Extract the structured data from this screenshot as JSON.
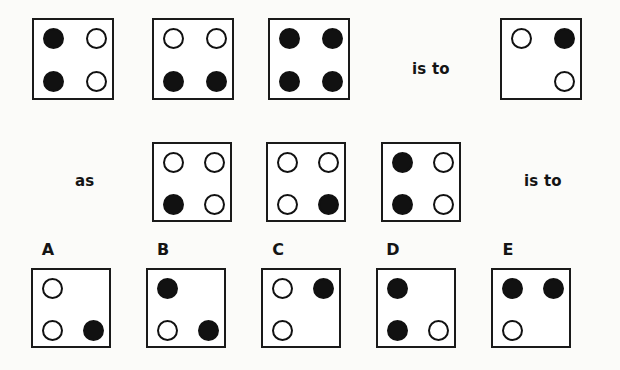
{
  "puzzle": {
    "type": "visual-analogy-matrix",
    "connector_1": "is to",
    "connector_2": "as",
    "connector_3": "is to",
    "dot_states": {
      "filled": "filled",
      "open": "open",
      "none": "none"
    },
    "row1": {
      "name": "premise-row",
      "boxes": [
        {
          "id": "row1-box1",
          "x": 32,
          "y": 18,
          "size": 82,
          "dots": {
            "top_left": "filled",
            "top_right": "open",
            "bottom_left": "filled",
            "bottom_right": "open"
          }
        },
        {
          "id": "row1-box2",
          "x": 152,
          "y": 18,
          "size": 82,
          "dots": {
            "top_left": "open",
            "top_right": "open",
            "bottom_left": "filled",
            "bottom_right": "filled"
          }
        },
        {
          "id": "row1-box3",
          "x": 268,
          "y": 18,
          "size": 82,
          "dots": {
            "top_left": "filled",
            "top_right": "filled",
            "bottom_left": "filled",
            "bottom_right": "filled"
          }
        },
        {
          "id": "row1-box4",
          "x": 500,
          "y": 18,
          "size": 82,
          "dots": {
            "top_left": "open",
            "top_right": "filled",
            "bottom_left": "none",
            "bottom_right": "open"
          }
        }
      ],
      "connector": {
        "label": "is to",
        "x": 412,
        "y": 60
      }
    },
    "row2": {
      "name": "analogy-row",
      "connector_left": {
        "label": "as",
        "x": 75,
        "y": 172
      },
      "boxes": [
        {
          "id": "row2-box1",
          "x": 152,
          "y": 142,
          "size": 80,
          "dots": {
            "top_left": "open",
            "top_right": "open",
            "bottom_left": "filled",
            "bottom_right": "open"
          }
        },
        {
          "id": "row2-box2",
          "x": 266,
          "y": 142,
          "size": 80,
          "dots": {
            "top_left": "open",
            "top_right": "open",
            "bottom_left": "open",
            "bottom_right": "filled"
          }
        },
        {
          "id": "row2-box3",
          "x": 381,
          "y": 142,
          "size": 80,
          "dots": {
            "top_left": "filled",
            "top_right": "open",
            "bottom_left": "filled",
            "bottom_right": "open"
          }
        }
      ],
      "connector_right": {
        "label": "is to",
        "x": 524,
        "y": 172
      }
    },
    "options": {
      "name": "answer-options-row",
      "letters": [
        {
          "label": "A",
          "x": 48,
          "y": 240
        },
        {
          "label": "B",
          "x": 163,
          "y": 240
        },
        {
          "label": "C",
          "x": 278,
          "y": 240
        },
        {
          "label": "D",
          "x": 393,
          "y": 240
        },
        {
          "label": "E",
          "x": 508,
          "y": 240
        }
      ],
      "boxes": [
        {
          "id": "option-a",
          "letter": "A",
          "x": 31,
          "y": 268,
          "size": 80,
          "dots": {
            "top_left": "open",
            "top_right": "none",
            "bottom_left": "open",
            "bottom_right": "filled"
          }
        },
        {
          "id": "option-b",
          "letter": "B",
          "x": 146,
          "y": 268,
          "size": 80,
          "dots": {
            "top_left": "filled",
            "top_right": "none",
            "bottom_left": "open",
            "bottom_right": "filled"
          }
        },
        {
          "id": "option-c",
          "letter": "C",
          "x": 261,
          "y": 268,
          "size": 80,
          "dots": {
            "top_left": "open",
            "top_right": "filled",
            "bottom_left": "open",
            "bottom_right": "none"
          }
        },
        {
          "id": "option-d",
          "letter": "D",
          "x": 376,
          "y": 268,
          "size": 80,
          "dots": {
            "top_left": "filled",
            "top_right": "none",
            "bottom_left": "filled",
            "bottom_right": "open"
          }
        },
        {
          "id": "option-e",
          "letter": "E",
          "x": 491,
          "y": 268,
          "size": 80,
          "dots": {
            "top_left": "filled",
            "top_right": "filled",
            "bottom_left": "open",
            "bottom_right": "none"
          }
        }
      ]
    },
    "colors": {
      "ink": "#111111",
      "box_border": "#1a1a1a",
      "box_fill": "#ffffff",
      "page_background": "#fbfbf9"
    },
    "dot_diameter": 21
  }
}
